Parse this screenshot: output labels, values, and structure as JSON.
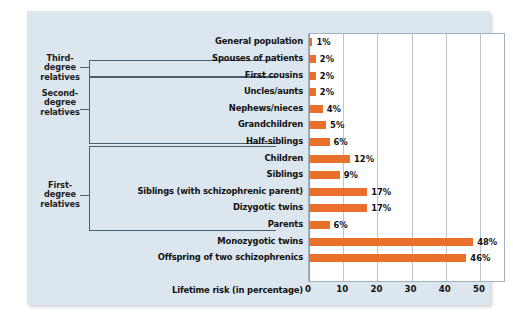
{
  "chart_data": {
    "type": "bar",
    "orientation": "horizontal",
    "title": "",
    "xlabel": "Lifetime risk (in percentage)",
    "ylabel": "",
    "xlim": [
      0,
      57.6
    ],
    "xticks": [
      0,
      10,
      20,
      30,
      40,
      50
    ],
    "grid": true,
    "legend": false,
    "bar_color": "#e8702a",
    "plot_background": "#ffffff",
    "panel_background": "#dce6ee",
    "categories": [
      "General population",
      "Spouses of patients",
      "First cousins",
      "Uncles/aunts",
      "Nephews/nieces",
      "Grandchildren",
      "Half-siblings",
      "Children",
      "Siblings",
      "Siblings (with schizophrenic parent)",
      "Dizygotic twins",
      "Parents",
      "Monozygotic twins",
      "Offspring of two schizophrenics"
    ],
    "values": [
      1,
      2,
      2,
      2,
      4,
      5,
      6,
      12,
      9,
      17,
      17,
      6,
      48,
      46
    ],
    "value_labels": [
      "1%",
      "2%",
      "2%",
      "2%",
      "4%",
      "5%",
      "6%",
      "12%",
      "9%",
      "17%",
      "17%",
      "6%",
      "48%",
      "46%"
    ],
    "groups": [
      {
        "label": "Third-\ndegree\nrelatives",
        "members": [
          "First cousins"
        ]
      },
      {
        "label": "Second-\ndegree\nrelatives",
        "members": [
          "Uncles/aunts",
          "Nephews/nieces",
          "Grandchildren",
          "Half-siblings"
        ]
      },
      {
        "label": "First-\ndegree\nrelatives",
        "members": [
          "Children",
          "Siblings",
          "Siblings (with schizophrenic parent)",
          "Dizygotic twins",
          "Parents"
        ]
      }
    ]
  },
  "groups": {
    "third": {
      "line1": "Third-",
      "line2": "degree",
      "line3": "relatives"
    },
    "second": {
      "line1": "Second-",
      "line2": "degree",
      "line3": "relatives"
    },
    "first": {
      "line1": "First-",
      "line2": "degree",
      "line3": "relatives"
    }
  },
  "axis": {
    "t0": "0",
    "t1": "10",
    "t2": "20",
    "t3": "30",
    "t4": "40",
    "t5": "50",
    "caption": "Lifetime risk (in percentage)"
  }
}
